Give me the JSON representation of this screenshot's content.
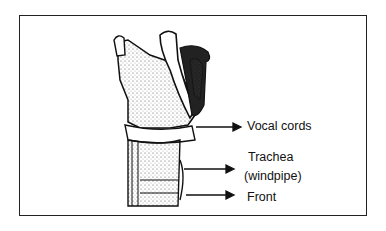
{
  "diagram": {
    "labels": {
      "vocal_cords": "Vocal cords",
      "trachea": "Trachea",
      "windpipe": "(windpipe)",
      "front": "Front"
    }
  }
}
